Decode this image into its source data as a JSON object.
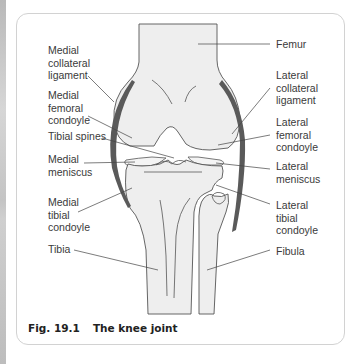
{
  "figure": {
    "number": "Fig. 19.1",
    "title": "The knee joint"
  },
  "labels": {
    "left": [
      {
        "id": "medial-collateral-ligament",
        "text": "Medial\ncollateral\nligament"
      },
      {
        "id": "medial-femoral-condoyle",
        "text": "Medial\nfemoral\ncondoyle"
      },
      {
        "id": "tibial-spines",
        "text": "Tibial spines"
      },
      {
        "id": "medial-meniscus",
        "text": "Medial\nmeniscus"
      },
      {
        "id": "medial-tibial-condoyle",
        "text": "Medial\ntibial\ncondoyle"
      },
      {
        "id": "tibia",
        "text": "Tibia"
      }
    ],
    "right": [
      {
        "id": "femur",
        "text": "Femur"
      },
      {
        "id": "lateral-collateral-ligament",
        "text": "Lateral\ncollateral\nligament"
      },
      {
        "id": "lateral-femoral-condoyle",
        "text": "Lateral\nfemoral\ncondoyle"
      },
      {
        "id": "lateral-meniscus",
        "text": "Lateral\nmeniscus"
      },
      {
        "id": "lateral-tibial-condoyle",
        "text": "Lateral\ntibial\ncondoyle"
      },
      {
        "id": "fibula",
        "text": "Fibula"
      }
    ]
  },
  "colors": {
    "bone_fill": "#eeeeee",
    "outline": "#555555",
    "ligament": "#5a5a5a",
    "leader_line": "#444444",
    "frame_border": "#d2d2d2"
  }
}
